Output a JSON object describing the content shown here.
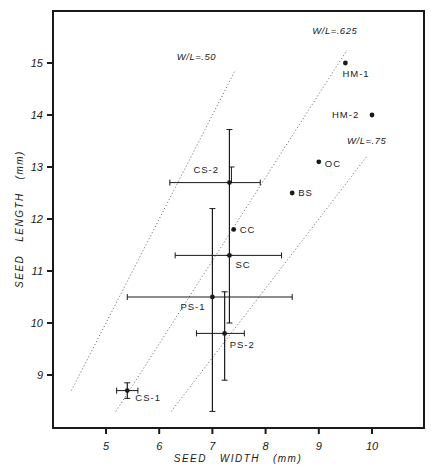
{
  "chart_data": {
    "type": "scatter",
    "title": "",
    "xlabel": "SEED   WIDTH   (mm)",
    "ylabel": "SEED   LENGTH   (mm)",
    "xlim": [
      4.0,
      11.0
    ],
    "ylim": [
      8.0,
      16.0
    ],
    "x_ticks": [
      5,
      6,
      7,
      8,
      9,
      10
    ],
    "y_ticks": [
      9,
      10,
      11,
      12,
      13,
      14,
      15
    ],
    "x_tick_labels": [
      "5",
      "6",
      "7",
      "8",
      "9",
      "10"
    ],
    "y_tick_labels": [
      "9",
      "10",
      "11",
      "12",
      "13",
      "14",
      "15"
    ],
    "grid": false,
    "legend": null,
    "points": [
      {
        "label": "HM-1",
        "x": 9.5,
        "y": 15.0,
        "label_dx": -3,
        "label_dy": 14
      },
      {
        "label": "HM-2",
        "x": 10.0,
        "y": 14.0,
        "label_dx": -40,
        "label_dy": 3
      },
      {
        "label": "OC",
        "x": 9.0,
        "y": 13.1,
        "label_dx": 6,
        "label_dy": 5
      },
      {
        "label": "BS",
        "x": 8.5,
        "y": 12.5,
        "label_dx": 6,
        "label_dy": 3
      },
      {
        "label": "CS-2",
        "x": 7.32,
        "y": 12.7,
        "xerr": [
          6.2,
          7.9
        ],
        "yerr": [
          11.3,
          13.72
        ],
        "yerr_inner_cap": 13.0,
        "label_dx": -36,
        "label_dy": -10
      },
      {
        "label": "CC",
        "x": 7.4,
        "y": 11.8,
        "label_dx": 6,
        "label_dy": 4
      },
      {
        "label": "SC",
        "x": 7.32,
        "y": 11.3,
        "xerr": [
          6.3,
          8.3
        ],
        "yerr": [
          10.0,
          11.3
        ],
        "label_dx": 6,
        "label_dy": 13
      },
      {
        "label": "PS-1",
        "x": 7.0,
        "y": 10.5,
        "xerr": [
          5.4,
          8.5
        ],
        "yerr": [
          8.3,
          12.2
        ],
        "label_dx": -32,
        "label_dy": 13
      },
      {
        "label": "PS-2",
        "x": 7.23,
        "y": 9.8,
        "xerr": [
          6.7,
          7.6
        ],
        "yerr": [
          8.9,
          10.6
        ],
        "label_dx": 5,
        "label_dy": 15
      },
      {
        "label": "CS-1",
        "x": 5.4,
        "y": 8.7,
        "xerr": [
          5.2,
          5.6
        ],
        "yerr": [
          8.55,
          8.85
        ],
        "label_dx": 8,
        "label_dy": 10
      }
    ],
    "ratio_lines": [
      {
        "label": "W/L=.50",
        "ratio": 0.5,
        "y_range": [
          8.7,
          14.85
        ],
        "label_x": 6.7,
        "label_y": 15.05
      },
      {
        "label": "W/L=.625",
        "ratio": 0.625,
        "y_range": [
          8.3,
          15.25
        ],
        "label_x": 9.3,
        "label_y": 15.55
      },
      {
        "label": "W/L=.75",
        "ratio": 0.75,
        "y_range": [
          8.3,
          13.2
        ],
        "label_x": 9.9,
        "label_y": 13.45
      }
    ]
  },
  "colors": {
    "ink": "#1a1a1a",
    "dotted_line": "#777777",
    "background": "#ffffff"
  }
}
